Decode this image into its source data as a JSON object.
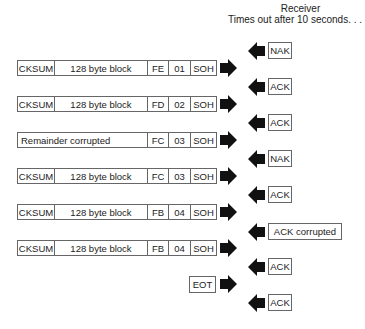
{
  "header": {
    "line1": "Receiver",
    "line2": "Times out after 10 seconds. . ."
  },
  "packets": [
    {
      "cksum": "CKSUM",
      "block": "128 byte block",
      "inv": "FE",
      "num": "01",
      "soh": "SOH"
    },
    {
      "cksum": "CKSUM",
      "block": "128 byte block",
      "inv": "FD",
      "num": "02",
      "soh": "SOH"
    },
    {
      "remainder": "Remainder corrupted",
      "inv": "FC",
      "num": "03",
      "soh": "SOH"
    },
    {
      "cksum": "CKSUM",
      "block": "128 byte block",
      "inv": "FC",
      "num": "03",
      "soh": "SOH"
    },
    {
      "cksum": "CKSUM",
      "block": "128 byte block",
      "inv": "FB",
      "num": "04",
      "soh": "SOH"
    },
    {
      "cksum": "CKSUM",
      "block": "128 byte block",
      "inv": "FB",
      "num": "04",
      "soh": "SOH"
    }
  ],
  "eot": "EOT",
  "responses": [
    "NAK",
    "ACK",
    "ACK",
    "NAK",
    "ACK",
    "ACK corrupted",
    "ACK",
    "ACK"
  ],
  "colors": {
    "arrow": "#111111",
    "border": "#666666"
  }
}
